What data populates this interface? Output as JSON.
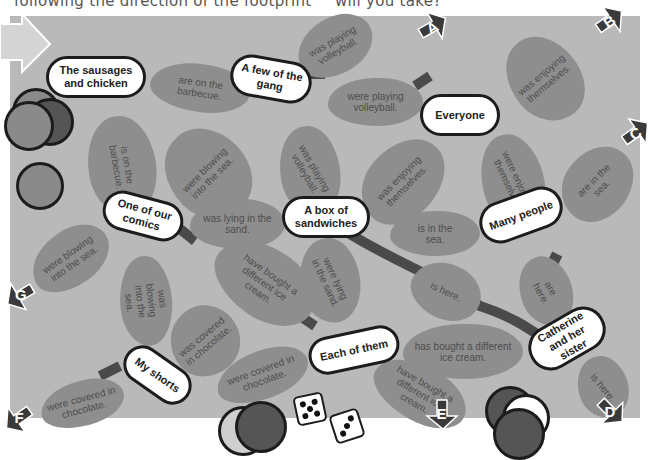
{
  "header": {
    "left_text": "following the direction of the footprint",
    "right_text": "will you take?"
  },
  "colors": {
    "board": "#b9b9b9",
    "footprint": "#8e8e8e",
    "footprint_text": "#4d4d4d",
    "node_fill": "#ffffff",
    "node_border": "#1c1c1c",
    "arrow": "#3a3a3a",
    "path": "#4a4a4a"
  },
  "nodes": {
    "sausages": "The sausages and chicken",
    "gang": "A few of the gang",
    "everyone": "Everyone",
    "comics": "One of our comics",
    "sandwiches": "A box of sandwiches",
    "many": "Many people",
    "shorts": "My shorts",
    "each": "Each of them",
    "catherine": "Catherine and her sister"
  },
  "footprints": {
    "f1": "are on the barbecue.",
    "f2": "was playing volleyball.",
    "f3": "were playing volleyball.",
    "f4": "was enjoying themselves.",
    "f5": "is on the barbecue.",
    "f6": "were blowing into the sea.",
    "f7": "was playing volleyball.",
    "f8": "was enjoying themselves.",
    "f9": "were enjoying themselves.",
    "f10": "are in the sea.",
    "f11": "was lying in the sand.",
    "f12": "is in the sea.",
    "f13": "were blowing into the sea.",
    "f14": "was blowing into the sea.",
    "f15": "have bought a different ice cream.",
    "f16": "were lying in the sand.",
    "f17": "is here.",
    "f18": "are here.",
    "f19": "was covered in chocolate.",
    "f20": "has bought a different ice cream.",
    "f21": "were covered in chocolate.",
    "f22": "have bought a different ice cream.",
    "f23": "is here.",
    "f24": "were covered in chocolate."
  },
  "exits": {
    "a": "A",
    "b": "B",
    "c": "C",
    "d": "D",
    "e": "E",
    "f": "F",
    "g": "G"
  },
  "dice": {
    "die1": 5,
    "die2": 3
  }
}
